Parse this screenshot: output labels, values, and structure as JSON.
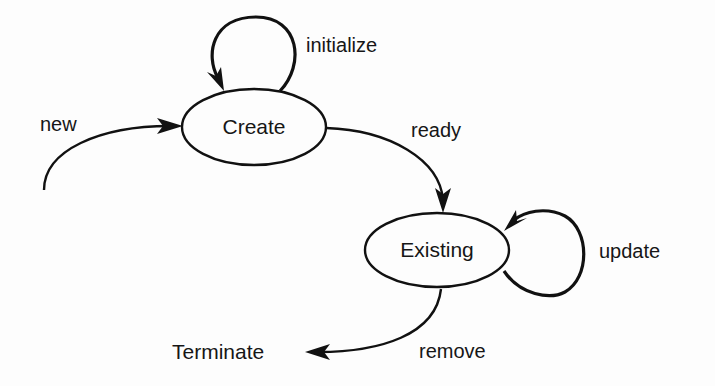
{
  "diagram": {
    "type": "state-transition",
    "states": [
      {
        "id": "create",
        "label": "Create"
      },
      {
        "id": "existing",
        "label": "Existing"
      },
      {
        "id": "terminate",
        "label": "Terminate"
      }
    ],
    "transitions": [
      {
        "id": "new",
        "label": "new",
        "from": null,
        "to": "create"
      },
      {
        "id": "initialize",
        "label": "initialize",
        "from": "create",
        "to": "create"
      },
      {
        "id": "ready",
        "label": "ready",
        "from": "create",
        "to": "existing"
      },
      {
        "id": "update",
        "label": "update",
        "from": "existing",
        "to": "existing"
      },
      {
        "id": "remove",
        "label": "remove",
        "from": "existing",
        "to": "terminate"
      }
    ],
    "colors": {
      "stroke": "#111111",
      "text": "#161616",
      "background": "#fdfdfd"
    }
  }
}
